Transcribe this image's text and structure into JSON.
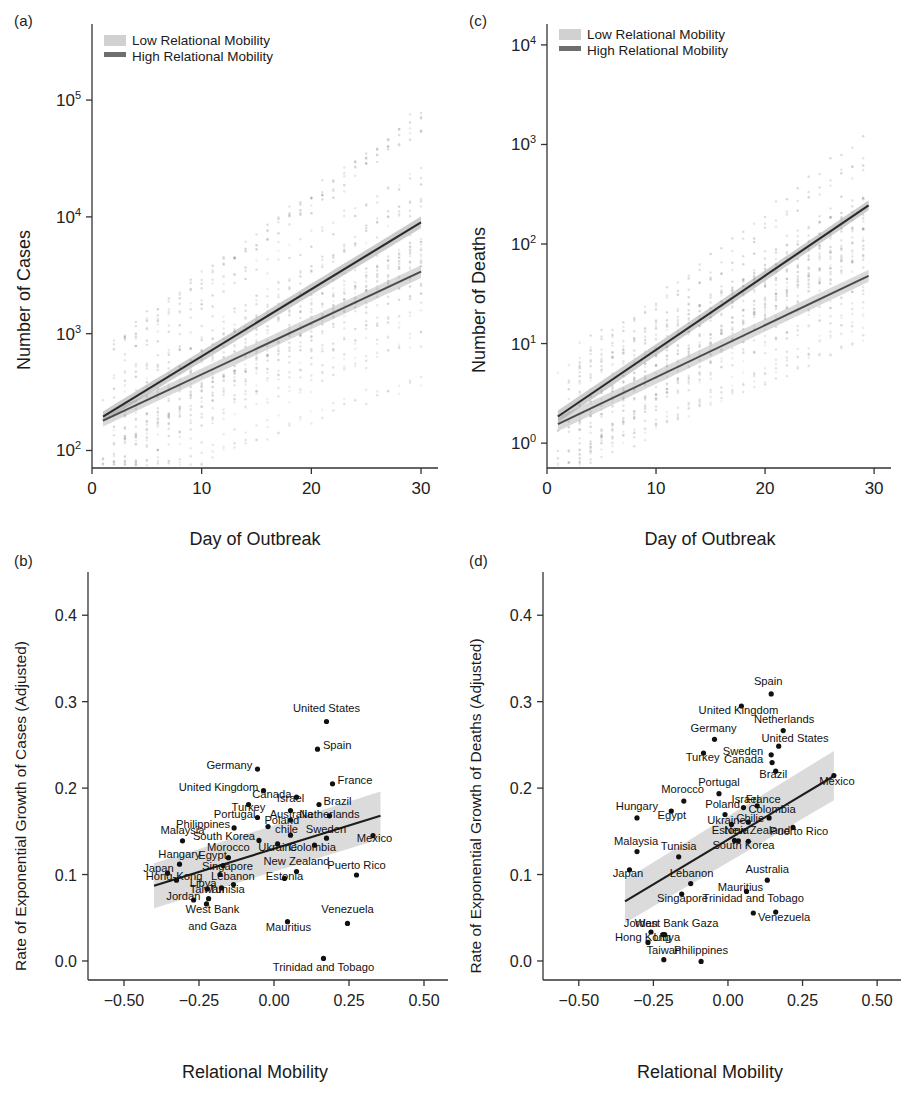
{
  "figure": {
    "panels": [
      "(a)",
      "(b)",
      "(c)",
      "(d)"
    ]
  },
  "legend": {
    "low_label": "Low Relational Mobility",
    "high_label": "High Relational Mobility",
    "low_color": "#c9c9c9",
    "high_color": "#6e6e6e"
  },
  "chart_data": [
    {
      "panel": "(a)",
      "type": "line",
      "title": "",
      "xlabel": "Day of Outbreak",
      "ylabel": "Number of Cases",
      "xlim": [
        0,
        31
      ],
      "ylim_log10": [
        1.85,
        5.6
      ],
      "yscale": "log",
      "xticks": [
        0,
        10,
        20,
        30
      ],
      "xticklabels": [
        "0",
        "10",
        "20",
        "30"
      ],
      "yticks_log10": [
        2,
        3,
        4,
        5
      ],
      "yticklabels": [
        "10^2",
        "10^3",
        "10^4",
        "10^5"
      ],
      "grid": false,
      "legend_position": "top-left",
      "series": [
        {
          "name": "Low Relational Mobility",
          "x": [
            1,
            30
          ],
          "y": [
            180,
            3400
          ],
          "log10_y": [
            2.255,
            3.531
          ],
          "ci_halfwidth_log10": [
            0.05,
            0.055
          ]
        },
        {
          "name": "High Relational Mobility",
          "x": [
            1,
            30
          ],
          "y": [
            195,
            9000
          ],
          "log10_y": [
            2.29,
            3.954
          ],
          "ci_halfwidth_log10": [
            0.045,
            0.05
          ]
        }
      ]
    },
    {
      "panel": "(c)",
      "type": "line",
      "title": "",
      "xlabel": "Day of Outbreak",
      "ylabel": "Number of Deaths",
      "xlim": [
        0,
        31
      ],
      "ylim_log10": [
        -0.25,
        4.15
      ],
      "yscale": "log",
      "xticks": [
        0,
        10,
        20,
        30
      ],
      "xticklabels": [
        "0",
        "10",
        "20",
        "30"
      ],
      "yticks_log10": [
        0,
        1,
        2,
        3,
        4
      ],
      "yticklabels": [
        "10^0",
        "10^1",
        "10^2",
        "10^3",
        "10^4"
      ],
      "grid": false,
      "legend_position": "top-left",
      "series": [
        {
          "name": "Low Relational Mobility",
          "x": [
            1,
            29.5
          ],
          "y": [
            1.55,
            48
          ],
          "log10_y": [
            0.19,
            1.681
          ],
          "ci_halfwidth_log10": [
            0.07,
            0.06
          ]
        },
        {
          "name": "High Relational Mobility",
          "x": [
            1,
            29.5
          ],
          "y": [
            1.85,
            245
          ],
          "log10_y": [
            0.267,
            2.389
          ],
          "ci_halfwidth_log10": [
            0.06,
            0.05
          ]
        }
      ]
    },
    {
      "panel": "(b)",
      "type": "scatter",
      "title": "",
      "xlabel": "Relational Mobility",
      "ylabel": "Rate of Exponential Growth of Cases (Adjusted)",
      "xlim": [
        -0.62,
        0.58
      ],
      "ylim": [
        -0.022,
        0.45
      ],
      "xticks": [
        -0.5,
        -0.25,
        0,
        0.25,
        0.5
      ],
      "xticklabels": [
        "−0.50",
        "−0.25",
        "0.00",
        "0.25",
        "0.50"
      ],
      "yticks": [
        0.0,
        0.1,
        0.2,
        0.3,
        0.4
      ],
      "yticklabels": [
        "0.0",
        "0.1",
        "0.2",
        "0.3",
        "0.4"
      ],
      "grid": false,
      "fit_line": {
        "x": [
          -0.4,
          0.355
        ],
        "y": [
          0.087,
          0.168
        ]
      },
      "ci_band": {
        "x": [
          -0.4,
          0.355
        ],
        "upper": [
          0.113,
          0.196
        ],
        "lower": [
          0.061,
          0.141
        ]
      },
      "points": [
        {
          "label": "United States",
          "x": 0.175,
          "y": 0.277,
          "lx": 0.175,
          "ly": 0.288,
          "anchor": "middle"
        },
        {
          "label": "Spain",
          "x": 0.145,
          "y": 0.245,
          "lx": 0.163,
          "ly": 0.245,
          "anchor": "start"
        },
        {
          "label": "Germany",
          "x": -0.055,
          "y": 0.222,
          "lx": -0.072,
          "ly": 0.222,
          "anchor": "end"
        },
        {
          "label": "France",
          "x": 0.195,
          "y": 0.205,
          "lx": 0.212,
          "ly": 0.205,
          "anchor": "start"
        },
        {
          "label": "United Kingdom",
          "x": -0.035,
          "y": 0.197,
          "lx": -0.052,
          "ly": 0.1965,
          "anchor": "end"
        },
        {
          "label": "Canada",
          "x": 0.075,
          "y": 0.1895,
          "lx": 0.058,
          "ly": 0.189,
          "anchor": "end"
        },
        {
          "label": "Brazil",
          "x": 0.15,
          "y": 0.181,
          "lx": 0.165,
          "ly": 0.181,
          "anchor": "start"
        },
        {
          "label": "Turkey",
          "x": -0.085,
          "y": 0.181,
          "lx": -0.085,
          "ly": 0.1735,
          "anchor": "middle"
        },
        {
          "label": "Israel",
          "x": 0.055,
          "y": 0.174,
          "lx": 0.055,
          "ly": 0.1835,
          "anchor": "middle"
        },
        {
          "label": "Netherlands",
          "x": 0.185,
          "y": 0.168,
          "lx": 0.185,
          "ly": 0.1655,
          "anchor": "middle"
        },
        {
          "label": "Australia",
          "x": 0.055,
          "y": 0.163,
          "lx": 0.058,
          "ly": 0.1655,
          "anchor": "middle"
        },
        {
          "label": "Portugal",
          "x": -0.055,
          "y": 0.166,
          "lx": -0.062,
          "ly": 0.1655,
          "anchor": "end"
        },
        {
          "label": "Poland",
          "x": -0.02,
          "y": 0.1555,
          "lx": -0.032,
          "ly": 0.1585,
          "anchor": "start"
        },
        {
          "label": "Philippines",
          "x": -0.133,
          "y": 0.154,
          "lx": -0.146,
          "ly": 0.1535,
          "anchor": "end"
        },
        {
          "label": "Sweden",
          "x": 0.175,
          "y": 0.142,
          "lx": 0.173,
          "ly": 0.1485,
          "anchor": "middle"
        },
        {
          "label": "chile",
          "x": 0.055,
          "y": 0.1455,
          "lx": 0.042,
          "ly": 0.1485,
          "anchor": "middle"
        },
        {
          "label": "Mexico",
          "x": 0.33,
          "y": 0.145,
          "lx": 0.335,
          "ly": 0.1375,
          "anchor": "middle"
        },
        {
          "label": "Malaysia",
          "x": -0.305,
          "y": 0.139,
          "lx": -0.305,
          "ly": 0.1475,
          "anchor": "middle"
        },
        {
          "label": "South Korea",
          "x": -0.05,
          "y": 0.1395,
          "lx": -0.063,
          "ly": 0.1395,
          "anchor": "end"
        },
        {
          "label": "Colombia",
          "x": 0.135,
          "y": 0.134,
          "lx": 0.128,
          "ly": 0.1275,
          "anchor": "middle"
        },
        {
          "label": "Ukraine",
          "x": 0.012,
          "y": 0.1355,
          "lx": 0.012,
          "ly": 0.1275,
          "anchor": "middle"
        },
        {
          "label": "Morocco",
          "x": -0.152,
          "y": 0.1195,
          "lx": -0.152,
          "ly": 0.1275,
          "anchor": "middle"
        },
        {
          "label": "Hangary",
          "x": -0.315,
          "y": 0.112,
          "lx": -0.315,
          "ly": 0.1195,
          "anchor": "middle"
        },
        {
          "label": "Egypt",
          "x": -0.17,
          "y": 0.1105,
          "lx": -0.205,
          "ly": 0.1185,
          "anchor": "middle"
        },
        {
          "label": "New Zealand",
          "x": 0.075,
          "y": 0.1035,
          "lx": 0.075,
          "ly": 0.1115,
          "anchor": "middle"
        },
        {
          "label": "Puerto Rico",
          "x": 0.275,
          "y": 0.0995,
          "lx": 0.275,
          "ly": 0.1065,
          "anchor": "middle"
        },
        {
          "label": "Singapore",
          "x": -0.18,
          "y": 0.1,
          "lx": -0.155,
          "ly": 0.1055,
          "anchor": "middle"
        },
        {
          "label": "Japan",
          "x": -0.355,
          "y": 0.1015,
          "lx": -0.385,
          "ly": 0.1035,
          "anchor": "middle"
        },
        {
          "label": "Hong-Kong",
          "x": -0.325,
          "y": 0.0935,
          "lx": -0.333,
          "ly": 0.0935,
          "anchor": "middle"
        },
        {
          "label": "Lebanon",
          "x": -0.135,
          "y": 0.0885,
          "lx": -0.137,
          "ly": 0.0935,
          "anchor": "middle"
        },
        {
          "label": "Estonia",
          "x": 0.035,
          "y": 0.0955,
          "lx": 0.035,
          "ly": 0.0935,
          "anchor": "middle"
        },
        {
          "label": "Libya",
          "x": -0.222,
          "y": 0.0835,
          "lx": -0.236,
          "ly": 0.0855,
          "anchor": "middle"
        },
        {
          "label": "Tunisia",
          "x": -0.175,
          "y": 0.0845,
          "lx": -0.157,
          "ly": 0.0785,
          "anchor": "middle"
        },
        {
          "label": "Taiwan",
          "x": -0.218,
          "y": 0.072,
          "lx": -0.223,
          "ly": 0.0785,
          "anchor": "middle"
        },
        {
          "label": "Jordan",
          "x": -0.268,
          "y": 0.0705,
          "lx": -0.302,
          "ly": 0.0705,
          "anchor": "middle"
        },
        {
          "label": "Venezuela",
          "x": 0.245,
          "y": 0.0435,
          "lx": 0.245,
          "ly": 0.0555,
          "anchor": "middle"
        },
        {
          "label": "Mauritius",
          "x": 0.045,
          "y": 0.0455,
          "lx": 0.048,
          "ly": 0.0345,
          "anchor": "middle"
        },
        {
          "label": "West Bank",
          "x": -0.225,
          "y": 0.066,
          "lx": -0.205,
          "ly": 0.0555,
          "anchor": "middle"
        },
        {
          "label": "and Gaza",
          "x": null,
          "y": null,
          "lx": -0.205,
          "ly": 0.0355,
          "anchor": "middle"
        },
        {
          "label": "Trinidad and Tobago",
          "x": 0.165,
          "y": 0.003,
          "lx": 0.165,
          "ly": -0.012,
          "anchor": "middle"
        }
      ]
    },
    {
      "panel": "(d)",
      "type": "scatter",
      "title": "",
      "xlabel": "Relational Mobility",
      "ylabel": "Rate of Exponential Growth of Deaths (Adjusted)",
      "xlim": [
        -0.62,
        0.58
      ],
      "ylim": [
        -0.022,
        0.45
      ],
      "xticks": [
        -0.5,
        -0.25,
        0,
        0.25,
        0.5
      ],
      "xticklabels": [
        "−0.50",
        "−0.25",
        "0.00",
        "0.25",
        "0.50"
      ],
      "yticks": [
        0.0,
        0.1,
        0.2,
        0.3,
        0.4
      ],
      "yticklabels": [
        "0.0",
        "0.1",
        "0.2",
        "0.3",
        "0.4"
      ],
      "grid": false,
      "fit_line": {
        "x": [
          -0.345,
          0.355
        ],
        "y": [
          0.069,
          0.214
        ]
      },
      "ci_band": {
        "x": [
          -0.345,
          0.355
        ],
        "upper": [
          0.094,
          0.243
        ],
        "lower": [
          0.044,
          0.186
        ]
      },
      "points": [
        {
          "label": "Spain",
          "x": 0.145,
          "y": 0.309,
          "lx": 0.135,
          "ly": 0.3195,
          "anchor": "middle"
        },
        {
          "label": "United Kingdom",
          "x": 0.045,
          "y": 0.295,
          "lx": 0.035,
          "ly": 0.2855,
          "anchor": "middle"
        },
        {
          "label": "Netherlands",
          "x": 0.185,
          "y": 0.2665,
          "lx": 0.188,
          "ly": 0.2755,
          "anchor": "middle"
        },
        {
          "label": "Germany",
          "x": -0.045,
          "y": 0.2565,
          "lx": -0.048,
          "ly": 0.2655,
          "anchor": "middle"
        },
        {
          "label": "United States",
          "x": 0.17,
          "y": 0.2485,
          "lx": 0.225,
          "ly": 0.2535,
          "anchor": "middle"
        },
        {
          "label": "Sweden",
          "x": 0.145,
          "y": 0.2385,
          "lx": 0.118,
          "ly": 0.2385,
          "anchor": "end"
        },
        {
          "label": "Turkey",
          "x": -0.082,
          "y": 0.2405,
          "lx": -0.085,
          "ly": 0.2315,
          "anchor": "middle"
        },
        {
          "label": "Canada",
          "x": 0.148,
          "y": 0.2295,
          "lx": 0.118,
          "ly": 0.2295,
          "anchor": "end"
        },
        {
          "label": "Brazil",
          "x": 0.16,
          "y": 0.2195,
          "lx": 0.152,
          "ly": 0.2115,
          "anchor": "middle"
        },
        {
          "label": "Mexico",
          "x": 0.355,
          "y": 0.2145,
          "lx": 0.365,
          "ly": 0.2035,
          "anchor": "middle"
        },
        {
          "label": "Portugal",
          "x": -0.03,
          "y": 0.1935,
          "lx": -0.03,
          "ly": 0.2025,
          "anchor": "middle"
        },
        {
          "label": "Morocco",
          "x": -0.148,
          "y": 0.185,
          "lx": -0.152,
          "ly": 0.1945,
          "anchor": "middle"
        },
        {
          "label": "Israel",
          "x": 0.052,
          "y": 0.1775,
          "lx": 0.058,
          "ly": 0.1825,
          "anchor": "middle"
        },
        {
          "label": "France",
          "x": 0.098,
          "y": 0.1795,
          "lx": 0.118,
          "ly": 0.1825,
          "anchor": "middle"
        },
        {
          "label": "Egypt",
          "x": -0.19,
          "y": 0.1735,
          "lx": -0.188,
          "ly": 0.1645,
          "anchor": "middle"
        },
        {
          "label": "Hungary",
          "x": -0.305,
          "y": 0.1655,
          "lx": -0.305,
          "ly": 0.1745,
          "anchor": "middle"
        },
        {
          "label": "Poland",
          "x": -0.01,
          "y": 0.1695,
          "lx": -0.018,
          "ly": 0.1765,
          "anchor": "middle"
        },
        {
          "label": "Colombia",
          "x": 0.138,
          "y": 0.1655,
          "lx": 0.148,
          "ly": 0.1715,
          "anchor": "middle"
        },
        {
          "label": "Chilie",
          "x": 0.068,
          "y": 0.1605,
          "lx": 0.075,
          "ly": 0.1605,
          "anchor": "middle"
        },
        {
          "label": "Ukraine",
          "x": 0.012,
          "y": 0.158,
          "lx": -0.005,
          "ly": 0.1585,
          "anchor": "middle"
        },
        {
          "label": "Puerto Rico",
          "x": 0.218,
          "y": 0.1545,
          "lx": 0.238,
          "ly": 0.1455,
          "anchor": "middle"
        },
        {
          "label": "Estonia",
          "x": 0.022,
          "y": 0.1395,
          "lx": 0.008,
          "ly": 0.1465,
          "anchor": "middle"
        },
        {
          "label": "New Zealand",
          "x": 0.068,
          "y": 0.1385,
          "lx": 0.098,
          "ly": 0.1465,
          "anchor": "middle"
        },
        {
          "label": "South Korea",
          "x": 0.035,
          "y": 0.139,
          "lx": 0.052,
          "ly": 0.1295,
          "anchor": "middle"
        },
        {
          "label": "Malaysia",
          "x": -0.305,
          "y": 0.1265,
          "lx": -0.308,
          "ly": 0.1345,
          "anchor": "middle"
        },
        {
          "label": "Tunisia",
          "x": -0.165,
          "y": 0.1205,
          "lx": -0.165,
          "ly": 0.1285,
          "anchor": "middle"
        },
        {
          "label": "Japan",
          "x": -0.33,
          "y": 0.1055,
          "lx": -0.335,
          "ly": 0.0975,
          "anchor": "middle"
        },
        {
          "label": "Australia",
          "x": 0.132,
          "y": 0.0935,
          "lx": 0.132,
          "ly": 0.1015,
          "anchor": "middle"
        },
        {
          "label": "Lebanon",
          "x": -0.125,
          "y": 0.0895,
          "lx": -0.122,
          "ly": 0.0975,
          "anchor": "middle"
        },
        {
          "label": "Mauritius",
          "x": 0.062,
          "y": 0.0805,
          "lx": 0.042,
          "ly": 0.0815,
          "anchor": "middle"
        },
        {
          "label": "Singapore",
          "x": -0.155,
          "y": 0.0775,
          "lx": -0.152,
          "ly": 0.0685,
          "anchor": "middle"
        },
        {
          "label": "Trinidad and Tobago",
          "x": 0.085,
          "y": 0.0555,
          "lx": 0.085,
          "ly": 0.0685,
          "anchor": "middle"
        },
        {
          "label": "Venezuela",
          "x": 0.16,
          "y": 0.0565,
          "lx": 0.188,
          "ly": 0.0465,
          "anchor": "middle"
        },
        {
          "label": "Jordan",
          "x": -0.258,
          "y": 0.0335,
          "lx": -0.292,
          "ly": 0.0395,
          "anchor": "middle"
        },
        {
          "label": "West Bank Gaza",
          "x": -0.218,
          "y": 0.0305,
          "lx": -0.172,
          "ly": 0.0395,
          "anchor": "middle"
        },
        {
          "label": "Hong Kong",
          "x": -0.268,
          "y": 0.0215,
          "lx": -0.285,
          "ly": 0.0235,
          "anchor": "middle"
        },
        {
          "label": "Libya",
          "x": -0.212,
          "y": 0.0305,
          "lx": -0.205,
          "ly": 0.0235,
          "anchor": "middle"
        },
        {
          "label": "Taiwan",
          "x": -0.215,
          "y": 0.0015,
          "lx": -0.215,
          "ly": 0.0085,
          "anchor": "middle"
        },
        {
          "label": "Philippines",
          "x": -0.09,
          "y": -0.0005,
          "lx": -0.09,
          "ly": 0.0085,
          "anchor": "middle"
        }
      ]
    }
  ]
}
